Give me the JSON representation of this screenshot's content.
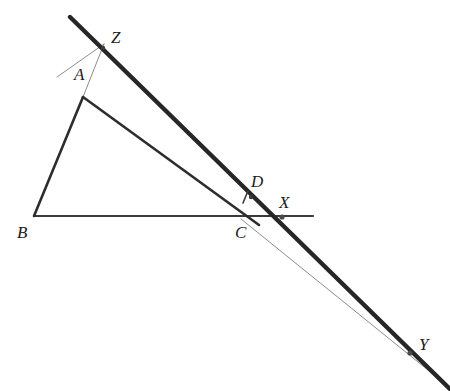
{
  "figure": {
    "name": "euclidean-geometry-construction",
    "background_color": "#ffffff",
    "width": 450,
    "height": 391,
    "stroke_color_heavy": "#262626",
    "stroke_color_medium": "#3a3a3a",
    "stroke_color_light": "#8d8d8d",
    "label_color": "#1c1c1c"
  },
  "labels": {
    "A": "A",
    "B": "B",
    "C": "C",
    "D": "D",
    "X": "X",
    "Y": "Y",
    "Z": "Z"
  },
  "points": {
    "A": {
      "x": 83,
      "y": 97
    },
    "B": {
      "x": 34,
      "y": 216
    },
    "C": {
      "x": 243,
      "y": 218
    },
    "D": {
      "x": 252,
      "y": 196
    },
    "X": {
      "x": 282,
      "y": 217
    },
    "Y": {
      "x": 410,
      "y": 353
    },
    "Z": {
      "x": 103,
      "y": 48
    }
  },
  "label_positions": {
    "A": {
      "x": 74,
      "y": 66
    },
    "B": {
      "x": 17,
      "y": 224
    },
    "C": {
      "x": 235,
      "y": 224
    },
    "D": {
      "x": 251,
      "y": 173
    },
    "X": {
      "x": 279,
      "y": 194
    },
    "Y": {
      "x": 419,
      "y": 336
    },
    "Z": {
      "x": 111,
      "y": 29
    }
  },
  "segments": [
    {
      "name": "thick-line-ZDY",
      "from": {
        "x": 70,
        "y": 17
      },
      "to": {
        "x": 450,
        "y": 389
      },
      "width": 4.4,
      "color": "#262626"
    },
    {
      "name": "segment-AB",
      "from": {
        "x": 83,
        "y": 97
      },
      "to": {
        "x": 34,
        "y": 216
      },
      "width": 2.6,
      "color": "#2d2d2d"
    },
    {
      "name": "segment-BC-extended-to-X",
      "from": {
        "x": 34,
        "y": 216
      },
      "to": {
        "x": 313,
        "y": 216
      },
      "width": 2.2,
      "color": "#3a3a3a"
    },
    {
      "name": "segment-AC",
      "from": {
        "x": 83,
        "y": 97
      },
      "to": {
        "x": 258,
        "y": 224
      },
      "width": 2.6,
      "color": "#2d2d2d"
    },
    {
      "name": "thin-line-AZ-extended",
      "from": {
        "x": 57,
        "y": 77
      },
      "to": {
        "x": 104,
        "y": 46
      },
      "width": 1.0,
      "color": "#8d8d8d"
    },
    {
      "name": "thin-line-CY",
      "from": {
        "x": 241,
        "y": 219
      },
      "to": {
        "x": 446,
        "y": 384
      },
      "width": 1.0,
      "color": "#8d8d8d"
    },
    {
      "name": "thin-line-AZ-through",
      "from": {
        "x": 83,
        "y": 97
      },
      "to": {
        "x": 104,
        "y": 44
      },
      "width": 1.0,
      "color": "#8d8d8d"
    },
    {
      "name": "right-angle-tick-at-D",
      "from": {
        "x": 247,
        "y": 192
      },
      "to": {
        "x": 243,
        "y": 202
      },
      "width": 1.6,
      "color": "#3a3a3a"
    }
  ],
  "dots": [
    {
      "name": "dot-X",
      "x": 282,
      "y": 217,
      "r": 2.6,
      "color": "#4a4a4a"
    },
    {
      "name": "dot-Y",
      "x": 410,
      "y": 353,
      "r": 2.6,
      "color": "#4a4a4a"
    },
    {
      "name": "dot-Z",
      "x": 103,
      "y": 48,
      "r": 2.2,
      "color": "#3a3a3a"
    },
    {
      "name": "dot-D",
      "x": 251,
      "y": 197,
      "r": 2.2,
      "color": "#3a3a3a"
    }
  ]
}
